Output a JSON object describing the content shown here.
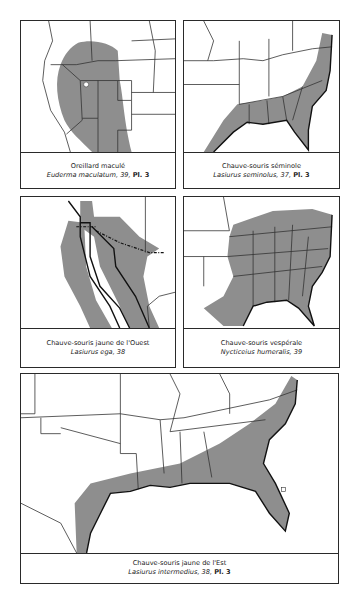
{
  "panels": [
    {
      "id": "top-left",
      "common_name": "Oreillard maculé",
      "scientific_name": "Euderma maculatum",
      "reference": ", 39, ",
      "plate": "Pl. 3"
    },
    {
      "id": "top-right",
      "common_name": "Chauve-souris séminole",
      "scientific_name": "Lasiurus seminolus",
      "reference": ", 37, ",
      "plate": "Pl. 3"
    },
    {
      "id": "middle-left",
      "common_name": "Chauve-souris jaune de l'Ouest",
      "scientific_name": "Lasiurus ega",
      "reference": ", 38",
      "plate": ""
    },
    {
      "id": "middle-right",
      "common_name": "Chauve-souris vespérale",
      "scientific_name": "Nycticeius humeralis",
      "reference": ", 39",
      "plate": ""
    },
    {
      "id": "bottom",
      "common_name": "Chauve-souris jaune de l'Est",
      "scientific_name": "Lasiurus intermedius",
      "reference": ", 38, ",
      "plate": "Pl. 3"
    }
  ],
  "colors": {
    "range_fill": "#8e8e8e",
    "border": "#2a2a2a",
    "background": "#ffffff"
  }
}
